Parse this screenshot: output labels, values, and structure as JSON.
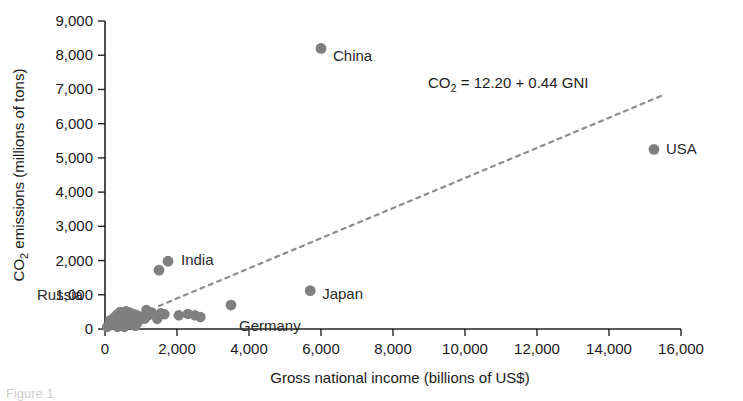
{
  "figure": {
    "caption_fragment": "Figure 1"
  },
  "chart_data": {
    "type": "scatter",
    "title": "",
    "xlabel": "Gross national income (billions of US$)",
    "ylabel": "CO2 emissions (millions of tons)",
    "ylabel_prefix": "CO",
    "ylabel_subscript": "2",
    "ylabel_suffix": " emissions (millions of tons)",
    "xlim": [
      0,
      16000
    ],
    "ylim": [
      0,
      9000
    ],
    "grid": false,
    "legend": "none",
    "xticks": [
      0,
      2000,
      4000,
      6000,
      8000,
      10000,
      12000,
      14000,
      16000
    ],
    "xtick_labels": [
      "0",
      "2,000",
      "4,000",
      "6,000",
      "8,000",
      "10,000",
      "12,000",
      "14,000",
      "16,000"
    ],
    "yticks": [
      0,
      1000,
      2000,
      3000,
      4000,
      5000,
      6000,
      7000,
      8000,
      9000
    ],
    "ytick_labels": [
      "0",
      "1,000",
      "2,000",
      "3,000",
      "4,000",
      "5,000",
      "6,000",
      "7,000",
      "8,000",
      "9,000"
    ],
    "annotation": {
      "text": "CO2 = 12.20 + 0.44 GNI",
      "prefix": "CO",
      "subscript": "2",
      "suffix": " = 12.20 + 0.44 GNI",
      "x": 11200,
      "y": 7050
    },
    "fit_line": {
      "intercept": 12.2,
      "slope": 0.44,
      "style": "dashed",
      "color": "#8c8c8c",
      "x_start": 1500,
      "x_end": 15450
    },
    "point_color": "#7f7f7f",
    "labeled_points": [
      {
        "label": "China",
        "x": 6000,
        "y": 8200,
        "label_dx": 12,
        "label_dy": 13
      },
      {
        "label": "USA",
        "x": 15250,
        "y": 5250,
        "label_dx": 12,
        "label_dy": 5
      },
      {
        "label": "India",
        "x": 1750,
        "y": 1980,
        "label_dx": 13,
        "label_dy": 4
      },
      {
        "label": "Russia",
        "x": 1500,
        "y": 1720,
        "label_dx": -122,
        "label_dy": 30
      },
      {
        "label": "Japan",
        "x": 5700,
        "y": 1120,
        "label_dx": 12,
        "label_dy": 8
      },
      {
        "label": "Germany",
        "x": 3500,
        "y": 700,
        "label_dx": 8,
        "label_dy": 26
      }
    ],
    "unlabeled_points": [
      {
        "x": 120,
        "y": 110
      },
      {
        "x": 200,
        "y": 180
      },
      {
        "x": 250,
        "y": 330
      },
      {
        "x": 300,
        "y": 120
      },
      {
        "x": 330,
        "y": 420
      },
      {
        "x": 380,
        "y": 250
      },
      {
        "x": 420,
        "y": 500
      },
      {
        "x": 430,
        "y": 150
      },
      {
        "x": 470,
        "y": 360
      },
      {
        "x": 500,
        "y": 460
      },
      {
        "x": 520,
        "y": 200
      },
      {
        "x": 560,
        "y": 330
      },
      {
        "x": 580,
        "y": 520
      },
      {
        "x": 600,
        "y": 120
      },
      {
        "x": 640,
        "y": 420
      },
      {
        "x": 660,
        "y": 250
      },
      {
        "x": 690,
        "y": 480
      },
      {
        "x": 720,
        "y": 150
      },
      {
        "x": 750,
        "y": 340
      },
      {
        "x": 790,
        "y": 220
      },
      {
        "x": 820,
        "y": 430
      },
      {
        "x": 860,
        "y": 300
      },
      {
        "x": 900,
        "y": 180
      },
      {
        "x": 940,
        "y": 380
      },
      {
        "x": 1150,
        "y": 560
      },
      {
        "x": 1200,
        "y": 400
      },
      {
        "x": 1300,
        "y": 480
      },
      {
        "x": 1450,
        "y": 300
      },
      {
        "x": 1550,
        "y": 460
      },
      {
        "x": 1650,
        "y": 430
      },
      {
        "x": 2050,
        "y": 400
      },
      {
        "x": 2300,
        "y": 440
      },
      {
        "x": 2500,
        "y": 400
      },
      {
        "x": 2650,
        "y": 350
      },
      {
        "x": 60,
        "y": 60
      },
      {
        "x": 150,
        "y": 260
      },
      {
        "x": 350,
        "y": 60
      },
      {
        "x": 450,
        "y": 290
      },
      {
        "x": 540,
        "y": 60
      },
      {
        "x": 700,
        "y": 330
      },
      {
        "x": 840,
        "y": 90
      },
      {
        "x": 1100,
        "y": 300
      }
    ]
  }
}
